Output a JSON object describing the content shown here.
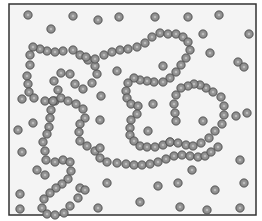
{
  "diagram": {
    "colors": {
      "background": "#f4f4f4",
      "frame": "#333333",
      "bead_fill": "#8a8a8a",
      "bead_edge": "#555555",
      "bead_highlight": "#d8d8d8"
    },
    "chains": [
      {
        "name": "chain-top",
        "beads": [
          [
            30,
            65
          ],
          [
            27,
            76
          ],
          [
            28,
            84
          ],
          [
            29,
            92
          ],
          [
            34,
            98
          ],
          [
            45,
            101
          ],
          [
            55,
            101
          ],
          [
            58,
            90
          ],
          [
            54,
            81
          ],
          [
            61,
            73
          ],
          [
            70,
            74
          ],
          [
            75,
            84
          ],
          [
            83,
            89
          ],
          [
            92,
            83
          ],
          [
            97,
            74
          ],
          [
            95,
            66
          ],
          [
            88,
            60
          ],
          [
            80,
            55
          ],
          [
            73,
            50
          ],
          [
            63,
            51
          ],
          [
            55,
            52
          ],
          [
            47,
            51
          ],
          [
            40,
            49
          ],
          [
            33,
            47
          ],
          [
            30,
            55
          ]
        ]
      },
      {
        "name": "chain-middle",
        "beads": [
          [
            95,
            59
          ],
          [
            104,
            55
          ],
          [
            112,
            52
          ],
          [
            120,
            50
          ],
          [
            128,
            49
          ],
          [
            137,
            47
          ],
          [
            145,
            43
          ],
          [
            152,
            37
          ],
          [
            160,
            33
          ],
          [
            168,
            34
          ],
          [
            176,
            34
          ],
          [
            183,
            37
          ],
          [
            188,
            42
          ],
          [
            190,
            50
          ],
          [
            186,
            58
          ],
          [
            181,
            65
          ],
          [
            176,
            72
          ],
          [
            170,
            78
          ],
          [
            163,
            82
          ],
          [
            154,
            82
          ],
          [
            147,
            81
          ],
          [
            140,
            80
          ],
          [
            134,
            78
          ],
          [
            128,
            83
          ],
          [
            126,
            91
          ],
          [
            127,
            98
          ],
          [
            131,
            104
          ],
          [
            138,
            106
          ],
          [
            137,
            114
          ],
          [
            131,
            120
          ],
          [
            130,
            128
          ],
          [
            130,
            135
          ],
          [
            134,
            141
          ],
          [
            140,
            146
          ],
          [
            147,
            147
          ],
          [
            155,
            147
          ],
          [
            163,
            145
          ],
          [
            170,
            142
          ]
        ]
      },
      {
        "name": "chain-right",
        "beads": [
          [
            170,
            142
          ],
          [
            178,
            143
          ],
          [
            186,
            145
          ],
          [
            193,
            146
          ],
          [
            201,
            143
          ],
          [
            209,
            138
          ],
          [
            215,
            131
          ],
          [
            222,
            124
          ],
          [
            224,
            115
          ],
          [
            224,
            106
          ],
          [
            221,
            97
          ],
          [
            213,
            92
          ],
          [
            206,
            88
          ],
          [
            200,
            85
          ],
          [
            194,
            84
          ],
          [
            188,
            86
          ],
          [
            181,
            88
          ],
          [
            176,
            95
          ],
          [
            174,
            104
          ],
          [
            175,
            113
          ],
          [
            176,
            121
          ]
        ]
      },
      {
        "name": "chain-left-loop",
        "beads": [
          [
            53,
            101
          ],
          [
            51,
            110
          ],
          [
            50,
            118
          ],
          [
            49,
            127
          ],
          [
            47,
            134
          ],
          [
            43,
            142
          ],
          [
            45,
            151
          ],
          [
            46,
            160
          ],
          [
            55,
            162
          ],
          [
            63,
            160
          ],
          [
            70,
            162
          ],
          [
            71,
            171
          ],
          [
            68,
            179
          ],
          [
            62,
            184
          ],
          [
            56,
            188
          ],
          [
            50,
            193
          ],
          [
            44,
            199
          ],
          [
            42,
            208
          ],
          [
            47,
            214
          ],
          [
            55,
            215
          ],
          [
            64,
            213
          ],
          [
            70,
            206
          ],
          [
            78,
            198
          ],
          [
            80,
            188
          ]
        ]
      },
      {
        "name": "chain-center-s",
        "beads": [
          [
            53,
            101
          ],
          [
            61,
            98
          ],
          [
            68,
            101
          ],
          [
            76,
            104
          ],
          [
            83,
            109
          ],
          [
            85,
            118
          ],
          [
            80,
            124
          ],
          [
            79,
            132
          ],
          [
            80,
            141
          ],
          [
            87,
            146
          ],
          [
            95,
            151
          ],
          [
            100,
            158
          ],
          [
            107,
            162
          ],
          [
            117,
            163
          ],
          [
            126,
            164
          ],
          [
            134,
            165
          ],
          [
            142,
            165
          ],
          [
            150,
            164
          ],
          [
            158,
            162
          ],
          [
            166,
            159
          ],
          [
            174,
            156
          ],
          [
            182,
            155
          ],
          [
            190,
            156
          ],
          [
            198,
            157
          ],
          [
            205,
            156
          ],
          [
            211,
            152
          ],
          [
            218,
            147
          ]
        ]
      }
    ],
    "free_monomers": [
      [
        28,
        15
      ],
      [
        73,
        16
      ],
      [
        98,
        20
      ],
      [
        119,
        17
      ],
      [
        155,
        17
      ],
      [
        188,
        17
      ],
      [
        219,
        15
      ],
      [
        51,
        29
      ],
      [
        203,
        34
      ],
      [
        249,
        34
      ],
      [
        210,
        53
      ],
      [
        238,
        62
      ],
      [
        86,
        57
      ],
      [
        117,
        71
      ],
      [
        163,
        66
      ],
      [
        101,
        96
      ],
      [
        244,
        67
      ],
      [
        22,
        99
      ],
      [
        100,
        120
      ],
      [
        236,
        116
      ],
      [
        33,
        123
      ],
      [
        153,
        104
      ],
      [
        148,
        131
      ],
      [
        203,
        121
      ],
      [
        18,
        130
      ],
      [
        100,
        148
      ],
      [
        247,
        113
      ],
      [
        22,
        152
      ],
      [
        37,
        170
      ],
      [
        192,
        170
      ],
      [
        178,
        183
      ],
      [
        244,
        183
      ],
      [
        107,
        183
      ],
      [
        158,
        186
      ],
      [
        215,
        190
      ],
      [
        20,
        194
      ],
      [
        98,
        208
      ],
      [
        140,
        202
      ],
      [
        180,
        207
      ],
      [
        207,
        210
      ],
      [
        240,
        208
      ],
      [
        20,
        209
      ],
      [
        85,
        190
      ],
      [
        45,
        175
      ],
      [
        240,
        160
      ]
    ]
  }
}
